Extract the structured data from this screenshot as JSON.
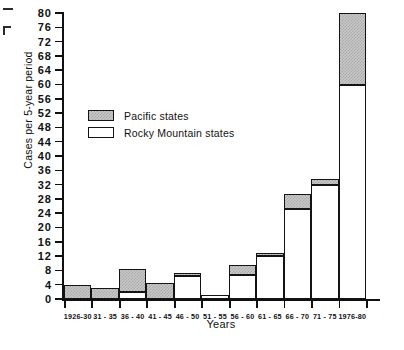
{
  "chart_data": {
    "type": "bar",
    "title": "",
    "subtitle": "",
    "xlabel": "Years",
    "ylabel": "Cases per 5-year period",
    "stacked": true,
    "grid": false,
    "legend_position": "inside-upper-left",
    "ylim": [
      0,
      80
    ],
    "ytick_step": 4,
    "ytick_labels": [
      "80",
      "76",
      "72",
      "68",
      "64",
      "60",
      "56",
      "52",
      "48",
      "44",
      "40",
      "36",
      "32",
      "28",
      "24",
      "20",
      "16",
      "12",
      "8",
      "4",
      "0"
    ],
    "categories": [
      "1926-30",
      "31 - 35",
      "36 - 40",
      "41 - 45",
      "46 - 50",
      "51 - 55",
      "56 - 60",
      "61 - 65",
      "66 - 70",
      "71 - 75",
      "1976-80"
    ],
    "series": [
      {
        "name": "Rocky Mountain states",
        "color": "#ffffff",
        "values": [
          0,
          0,
          2,
          0,
          6.5,
          1,
          6.7,
          12,
          25.3,
          32,
          60
        ]
      },
      {
        "name": "Pacific states",
        "color": "#c9c9c9",
        "values": [
          4,
          3,
          6.4,
          4.4,
          0.8,
          0,
          2.8,
          1,
          4,
          1.5,
          20
        ]
      }
    ],
    "totals": [
      4,
      3,
      8.4,
      4.4,
      7.3,
      1,
      9.5,
      13,
      29.3,
      33.5,
      80
    ]
  },
  "legend": {
    "entries": [
      {
        "label": "Pacific states",
        "swatch": "pacific"
      },
      {
        "label": "Rocky Mountain states",
        "swatch": "rocky"
      }
    ]
  }
}
